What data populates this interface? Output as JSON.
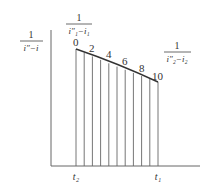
{
  "diagram": {
    "y_axis_label": {
      "numerator": "1",
      "denominator": "i″−i"
    },
    "top_label": {
      "numerator": "1",
      "denominator": "i″₁−i₁"
    },
    "right_label": {
      "numerator": "1",
      "denominator": "i″₂−i₂"
    },
    "point_labels": [
      "0",
      "2",
      "4",
      "6",
      "8",
      "10"
    ],
    "x_tick_left": "t₂",
    "x_tick_right": "t₁",
    "num_strips": 10,
    "colors": {
      "line": "#555555",
      "text": "#333333"
    }
  }
}
